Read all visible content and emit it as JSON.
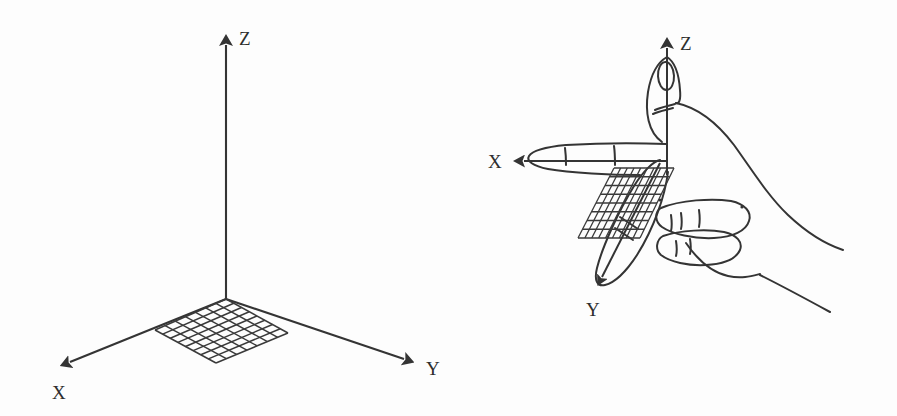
{
  "figure": {
    "background_color": "#fdfdfd",
    "ink_color": "#343434",
    "width": 897,
    "height": 416
  },
  "left_panel": {
    "name": "coordinate-axes-diagram",
    "description": "Three-dimensional Cartesian axes with a grid patch on the XY plane",
    "origin": {
      "x": 226,
      "y": 298
    },
    "axes": [
      {
        "id": "z",
        "label": "Z",
        "direction": "up",
        "tip": {
          "x": 226,
          "y": 33
        },
        "label_pos": {
          "x": 239,
          "y": 45
        }
      },
      {
        "id": "x",
        "label": "X",
        "direction": "down-left",
        "tip": {
          "x": 58,
          "y": 369
        },
        "label_pos": {
          "x": 52,
          "y": 398
        }
      },
      {
        "id": "y",
        "label": "Y",
        "direction": "down-right",
        "tip": {
          "x": 416,
          "y": 366
        },
        "label_pos": {
          "x": 426,
          "y": 374
        }
      }
    ],
    "grid_patch": {
      "name": "xy-plane-grid",
      "rows": 7,
      "cols": 8,
      "corners": [
        {
          "x": 226,
          "y": 299
        },
        {
          "x": 288,
          "y": 333
        },
        {
          "x": 216,
          "y": 363
        },
        {
          "x": 155,
          "y": 330
        }
      ]
    }
  },
  "right_panel": {
    "name": "right-hand-rule-sketch",
    "description": "Sketch of a right hand with thumb up along Z, index finger along X and middle finger along Y, with grid patch",
    "origin": {
      "x": 667,
      "y": 140
    },
    "axes": [
      {
        "id": "z",
        "label": "Z",
        "direction": "up",
        "tip": {
          "x": 667,
          "y": 36
        },
        "label_pos": {
          "x": 680,
          "y": 50
        }
      },
      {
        "id": "x",
        "label": "X",
        "direction": "left",
        "tip": {
          "x": 512,
          "y": 161
        },
        "label_pos": {
          "x": 490,
          "y": 168
        }
      },
      {
        "id": "y",
        "label": "Y",
        "direction": "down-left",
        "tip": {
          "x": 597,
          "y": 287
        },
        "label_pos": {
          "x": 586,
          "y": 315
        }
      }
    ],
    "grid_patch": {
      "name": "hand-plane-grid",
      "rows": 8,
      "cols": 9,
      "corners": [
        {
          "x": 614,
          "y": 168
        },
        {
          "x": 674,
          "y": 168
        },
        {
          "x": 640,
          "y": 238
        },
        {
          "x": 578,
          "y": 238
        }
      ]
    },
    "hand_parts": [
      "thumb-up",
      "index-finger-left",
      "middle-finger-down-left",
      "ring-finger-curled",
      "pinky-finger-curled",
      "palm",
      "wrist"
    ]
  }
}
